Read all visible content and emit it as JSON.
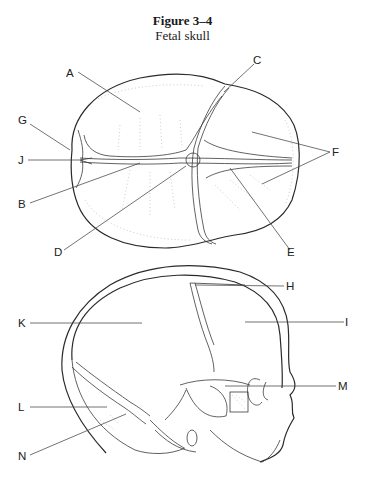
{
  "figure": {
    "number": "Figure 3–4",
    "caption": "Fetal skull"
  },
  "labels": {
    "A": "A",
    "B": "B",
    "C": "C",
    "D": "D",
    "E": "E",
    "F": "F",
    "G": "G",
    "H": "H",
    "I": "I",
    "J": "J",
    "K": "K",
    "L": "L",
    "M": "M",
    "N": "N"
  },
  "views": [
    {
      "name": "superior-view",
      "labels": [
        "A",
        "B",
        "C",
        "D",
        "E",
        "F",
        "G",
        "J"
      ]
    },
    {
      "name": "lateral-view",
      "labels": [
        "H",
        "I",
        "K",
        "L",
        "M",
        "N"
      ]
    }
  ]
}
